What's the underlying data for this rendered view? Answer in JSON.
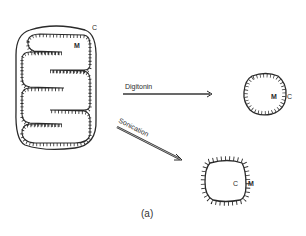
{
  "figure": {
    "caption": "(a)",
    "colors": {
      "ink": "#2a2a2a",
      "background": "#ffffff"
    }
  },
  "intact_mitochondrion": {
    "outer_label": "C",
    "inner_label": "M"
  },
  "treatments": [
    {
      "label": "Digitonin",
      "result": {
        "inner_label": "M",
        "outer_label": "C"
      }
    },
    {
      "label": "Sonication",
      "result": {
        "inner_label": "C",
        "outer_label": "M"
      }
    }
  ]
}
